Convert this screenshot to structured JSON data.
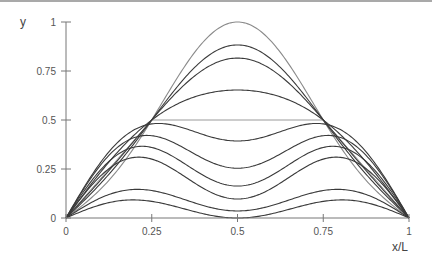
{
  "chart_data": {
    "type": "line",
    "title": "",
    "xlabel": "x/L",
    "ylabel": "y",
    "xlim": [
      0,
      1
    ],
    "ylim": [
      0,
      1
    ],
    "grid": false,
    "legend": "none",
    "x_ticks": [
      0,
      0.25,
      0.5,
      0.75,
      1
    ],
    "x_tick_labels": [
      "0",
      "0.25",
      "0.5",
      "0.75",
      "1"
    ],
    "y_ticks": [
      0,
      0.25,
      0.5,
      0.75,
      1
    ],
    "y_tick_labels": [
      "0",
      "0.25",
      "0.5",
      "0.75",
      "1"
    ],
    "initial_shape": {
      "name": "trapezoid",
      "x": [
        0,
        0.25,
        0.75,
        1
      ],
      "y": [
        0,
        0.5,
        0.5,
        0
      ],
      "color": "#9a9a9a"
    },
    "model": "y = A*sin(pi*x) + B*sin(3*pi*x)",
    "series": [
      {
        "name": "curve-1",
        "A": 0.854,
        "B": -0.146,
        "value_at_half": 1.0,
        "color": "#8a8a8a"
      },
      {
        "name": "curve-2",
        "A": 0.795,
        "B": -0.088,
        "value_at_half": 0.883,
        "color": "#3a3a3a"
      },
      {
        "name": "curve-3",
        "A": 0.762,
        "B": -0.054,
        "value_at_half": 0.816,
        "color": "#3a3a3a"
      },
      {
        "name": "curve-4",
        "A": 0.68,
        "B": 0.027,
        "value_at_half": 0.653,
        "color": "#3a3a3a"
      },
      {
        "name": "curve-5",
        "A": 0.536,
        "B": 0.143,
        "value_at_half": 0.393,
        "color": "#3a3a3a"
      },
      {
        "name": "curve-6",
        "A": 0.424,
        "B": 0.17,
        "value_at_half": 0.255,
        "color": "#3a3a3a"
      },
      {
        "name": "curve-7",
        "A": 0.336,
        "B": 0.173,
        "value_at_half": 0.163,
        "color": "#3a3a3a"
      },
      {
        "name": "curve-8",
        "A": 0.261,
        "B": 0.164,
        "value_at_half": 0.097,
        "color": "#3a3a3a"
      },
      {
        "name": "curve-9",
        "A": 0.117,
        "B": 0.081,
        "value_at_half": 0.036,
        "color": "#3a3a3a"
      },
      {
        "name": "curve-10",
        "A": 0.06,
        "B": 0.06,
        "value_at_half": 0.0,
        "color": "#3a3a3a"
      }
    ],
    "axis_color": "#777777"
  }
}
